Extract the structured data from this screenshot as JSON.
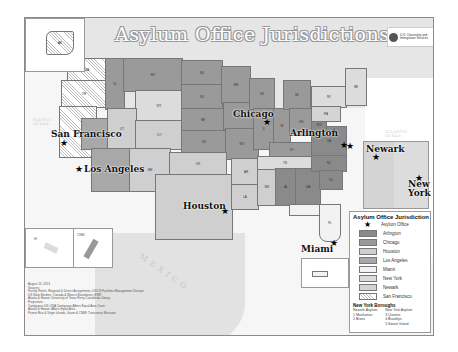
{
  "map": {
    "title": "Asylum Office Jurisdictions",
    "agency": "U.S. Citizenship and Immigration Services",
    "region_labels": {
      "canada": "CANADA",
      "mexico": "MEXICO",
      "pacific": "PACIFIC OCEAN",
      "atlantic": "ATLANTIC OCEAN",
      "gulf": "GULF OF MEXICO"
    },
    "cities": [
      {
        "name": "San Francisco",
        "office": "San Francisco"
      },
      {
        "name": "Los Angeles",
        "office": "Los Angeles"
      },
      {
        "name": "Chicago",
        "office": "Chicago"
      },
      {
        "name": "Arlington",
        "office": "Arlington"
      },
      {
        "name": "Houston",
        "office": "Houston"
      },
      {
        "name": "Miami",
        "office": "Miami"
      },
      {
        "name": "Newark",
        "office": "Newark"
      },
      {
        "name": "New York",
        "office": "New York"
      }
    ],
    "inset_labels": {
      "alaska": "AK",
      "hawaii": "HI",
      "guam": "CNMI",
      "puerto_rico": "PR"
    },
    "colors": {
      "arlington": "#8a8a8a",
      "chicago": "#9a9a9a",
      "houston": "#cfcfcf",
      "los_angeles": "#a8a8a8",
      "miami": "#f2f2f2",
      "new_york": "#dcdcdc",
      "newark": "#d4d4d4",
      "san_francisco": "hatched"
    }
  },
  "legend": {
    "title": "Asylum Office Jurisdiction",
    "items": [
      {
        "label": "Asylum Office",
        "symbol": "★"
      },
      {
        "label": "Arlington"
      },
      {
        "label": "Chicago"
      },
      {
        "label": "Houston"
      },
      {
        "label": "Los Angeles"
      },
      {
        "label": "Miami"
      },
      {
        "label": "New York"
      },
      {
        "label": "Newark"
      },
      {
        "label": "San Francisco"
      }
    ],
    "boroughs": {
      "title": "New York Boroughs",
      "newark_header": "Newark Asylum",
      "newark_items": [
        "1  Manhattan",
        "2  Bronx"
      ],
      "ny_header": "New York Asylum",
      "ny_items": [
        "3  Queens",
        "4  Brooklyn",
        "5  Staten Island"
      ]
    }
  },
  "credits": {
    "date": "August 13, 2013",
    "lines": [
      "Sources:",
      "Facility Points: Regional & District Assignments, USCIS Facilities Management Division",
      "US State Borders: Canada & Mexico Boundaries, ESRI",
      "Alaska & Hawaii: University of Texas Perry-Castañeda Library",
      "Projections:",
      "Contiguous US: USA Contiguous Albers Equal Area Conic",
      "Alaska & Hawaii: Albers Equal Area",
      "Puerto Rico & Virgin Islands, Guam & CNMI: Transverse Mercator"
    ]
  }
}
